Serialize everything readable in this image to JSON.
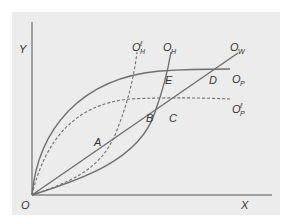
{
  "diagram": {
    "type": "economics-curve-diagram",
    "axes": {
      "origin_label": "O",
      "x_label": "X",
      "y_label": "Y"
    },
    "curves": [
      {
        "id": "OP",
        "label": "O",
        "subscript": "P",
        "prime": false,
        "style": "solid",
        "description": "concave curve rising from origin and flattening"
      },
      {
        "id": "OP_prime",
        "label": "O",
        "subscript": "P",
        "prime": true,
        "style": "dashed",
        "description": "lower concave dashed curve flattening"
      },
      {
        "id": "OW",
        "label": "O",
        "subscript": "W",
        "prime": false,
        "style": "solid",
        "description": "straight ray from origin"
      },
      {
        "id": "OH",
        "label": "O",
        "subscript": "H",
        "prime": false,
        "style": "solid",
        "description": "convex curve rising steeply"
      },
      {
        "id": "OH_prime",
        "label": "O",
        "subscript": "H",
        "prime": true,
        "style": "dashed",
        "description": "convex dashed curve rising steeply, left of OH"
      }
    ],
    "points": [
      {
        "label": "A"
      },
      {
        "label": "B"
      },
      {
        "label": "C"
      },
      {
        "label": "D"
      },
      {
        "label": "E"
      }
    ],
    "colors": {
      "background": "#ececec",
      "line": "#6e6e6e",
      "text": "#333333"
    }
  }
}
